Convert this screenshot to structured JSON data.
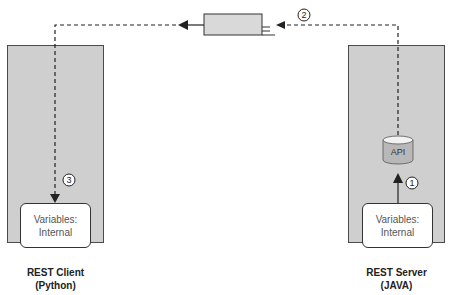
{
  "client": {
    "title": "REST Client",
    "subtitle": "(Python)",
    "variables_line1": "Variables:",
    "variables_line2": "Internal"
  },
  "server": {
    "title": "REST Server",
    "subtitle": "(JAVA)",
    "variables_line1": "Variables:",
    "variables_line2": "Internal",
    "api_label": "API"
  },
  "steps": {
    "one": "1",
    "two": "2",
    "three": "3"
  },
  "colors": {
    "panel": "#cfcfcf",
    "api_body": "#b8b8b8",
    "api_top": "#f2f2f2"
  }
}
